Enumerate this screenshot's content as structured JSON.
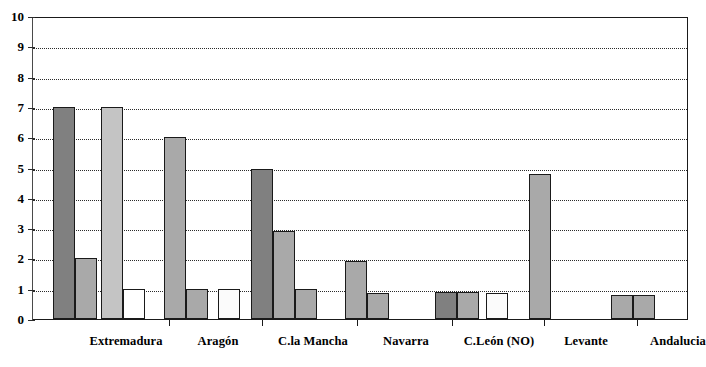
{
  "chart_data": {
    "type": "bar",
    "title": "",
    "xlabel": "",
    "ylabel": "",
    "ylim": [
      0,
      10
    ],
    "yticks": [
      "0",
      "1",
      "2",
      "3",
      "4",
      "5",
      "6",
      "7",
      "8",
      "9",
      "10"
    ],
    "grid": true,
    "legend": "none",
    "categories": [
      "Extremadura",
      "Aragón",
      "C.la Mancha",
      "Navarra",
      "C.León (NO)",
      "Levante",
      "Andalucia"
    ],
    "groups": [
      {
        "category": "Extremadura",
        "bars": [
          {
            "value": 7.0,
            "fill": "#808080"
          },
          {
            "value": 2.0,
            "fill": "#a9a9a9"
          },
          {
            "value": 7.0,
            "fill": "#c4c4c4"
          },
          {
            "value": 1.0,
            "fill": "#ffffff"
          }
        ]
      },
      {
        "category": "Aragón",
        "bars": [
          {
            "value": 6.0,
            "fill": "#a9a9a9"
          },
          {
            "value": 1.0,
            "fill": "#a9a9a9"
          },
          {
            "value": 1.0,
            "fill": "#fbfbfb"
          }
        ]
      },
      {
        "category": "C.la Mancha",
        "bars": [
          {
            "value": 4.95,
            "fill": "#808080"
          },
          {
            "value": 2.9,
            "fill": "#a9a9a9"
          },
          {
            "value": 1.0,
            "fill": "#a9a9a9"
          }
        ]
      },
      {
        "category": "Navarra",
        "bars": [
          {
            "value": 1.9,
            "fill": "#a9a9a9"
          },
          {
            "value": 0.85,
            "fill": "#a9a9a9"
          }
        ]
      },
      {
        "category": "C.León (NO)",
        "bars": [
          {
            "value": 0.88,
            "fill": "#808080"
          },
          {
            "value": 0.88,
            "fill": "#a9a9a9"
          },
          {
            "value": 0.85,
            "fill": "#fbfbfb"
          }
        ]
      },
      {
        "category": "Levante",
        "bars": [
          {
            "value": 4.8,
            "fill": "#a9a9a9"
          }
        ]
      },
      {
        "category": "Andalucia",
        "bars": [
          {
            "value": 0.78,
            "fill": "#a9a9a9"
          },
          {
            "value": 0.78,
            "fill": "#a9a9a9"
          }
        ]
      }
    ]
  },
  "axis": {
    "y_values": [
      10,
      9,
      8,
      7,
      6,
      5,
      4,
      3,
      2,
      1,
      0
    ]
  }
}
